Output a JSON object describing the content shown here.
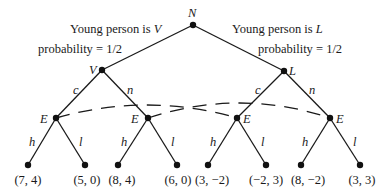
{
  "tree": {
    "root": {
      "label": "N"
    },
    "chance_labels": {
      "left": {
        "prefix": "Young person is ",
        "type": "V",
        "probability": "probability = 1/2"
      },
      "right": {
        "prefix": "Young person is ",
        "type": "L",
        "probability": "probability = 1/2"
      }
    },
    "type_nodes": [
      {
        "label": "V",
        "actions": [
          "c",
          "n"
        ]
      },
      {
        "label": "L",
        "actions": [
          "c",
          "n"
        ]
      }
    ],
    "employer_nodes": [
      {
        "label": "E",
        "actions": [
          "h",
          "l"
        ]
      },
      {
        "label": "E",
        "actions": [
          "h",
          "l"
        ]
      },
      {
        "label": "E",
        "actions": [
          "h",
          "l"
        ]
      },
      {
        "label": "E",
        "actions": [
          "h",
          "l"
        ]
      }
    ],
    "payoffs": [
      "(7, 4)",
      "(5, 0)",
      "(8, 4)",
      "(6, 0)",
      "(3, −2)",
      "(−2, 3)",
      "(8, −2)",
      "(3, 3)"
    ],
    "information_sets": [
      {
        "connects": [
          "E1",
          "E3"
        ],
        "style": "dashed"
      },
      {
        "connects": [
          "E2",
          "E4"
        ],
        "style": "dashed"
      }
    ]
  }
}
